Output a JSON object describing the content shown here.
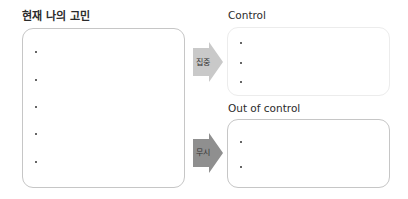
{
  "left_panel": {
    "title": "현재 나의 고민",
    "bullets": [
      "",
      "",
      "",
      "",
      ""
    ]
  },
  "arrows": [
    {
      "label": "집중",
      "color": "#c9c9c9"
    },
    {
      "label": "무시",
      "color": "#8f8f8f"
    }
  ],
  "control_panel": {
    "title": "Control",
    "bullets": [
      "",
      "",
      ""
    ]
  },
  "out_of_control_panel": {
    "title": "Out of control",
    "bullets": [
      "",
      ""
    ]
  }
}
